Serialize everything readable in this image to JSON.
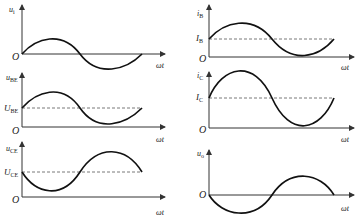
{
  "figure": {
    "x_axis_label": "ωt",
    "origin_label": "O",
    "panels": [
      {
        "id": "ui",
        "y_label_main": "u",
        "y_label_sub": "i",
        "dc_label_main": null,
        "dc_label_sub": null,
        "waveform": "sine, starts at 0 going positive"
      },
      {
        "id": "ube",
        "y_label_main": "u",
        "y_label_sub": "BE",
        "dc_label_main": "U",
        "dc_label_sub": "BE",
        "waveform": "sine on DC offset, in phase with ui"
      },
      {
        "id": "uce",
        "y_label_main": "u",
        "y_label_sub": "CE",
        "dc_label_main": "U",
        "dc_label_sub": "CE",
        "waveform": "sine on DC offset, inverted relative to ui"
      },
      {
        "id": "ib",
        "y_label_main": "i",
        "y_label_sub": "B",
        "dc_label_main": "I",
        "dc_label_sub": "B",
        "waveform": "sine on DC offset, in phase with ui"
      },
      {
        "id": "ic",
        "y_label_main": "i",
        "y_label_sub": "C",
        "dc_label_main": "I",
        "dc_label_sub": "C",
        "waveform": "sine on DC offset, in phase with ui, larger amplitude"
      },
      {
        "id": "uo",
        "y_label_main": "u",
        "y_label_sub": "o",
        "dc_label_main": null,
        "dc_label_sub": null,
        "waveform": "sine, starts at 0 going negative (inverted)"
      }
    ]
  }
}
